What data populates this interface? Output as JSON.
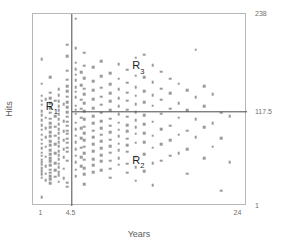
{
  "chart_data": {
    "type": "scatter",
    "title": "",
    "xlabel": "Years",
    "ylabel": "Hits",
    "xlim": [
      0,
      25
    ],
    "ylim": [
      1,
      238
    ],
    "grid": false,
    "legend": null,
    "xticks": [
      {
        "value": 1,
        "label": "1"
      },
      {
        "value": 4.5,
        "label": "4.5"
      },
      {
        "value": 24,
        "label": "24"
      }
    ],
    "yticks": [
      {
        "value": 238,
        "label": "238"
      },
      {
        "value": 117.5,
        "label": "117.5"
      },
      {
        "value": 1,
        "label": "1"
      }
    ],
    "splits": [
      {
        "name": "years-split",
        "orientation": "vertical",
        "value": 4.5,
        "variable": "Years"
      },
      {
        "name": "hits-split",
        "orientation": "horizontal",
        "value": 117.5,
        "variable": "Hits",
        "x_from": 4.5,
        "x_to": 24
      }
    ],
    "annotations": [
      {
        "name": "R1",
        "text": "R",
        "subscript": "1",
        "x": 2.2,
        "y": 122
      },
      {
        "name": "R2",
        "text": "R",
        "subscript": "2",
        "x": 12.3,
        "y": 55
      },
      {
        "name": "R3",
        "text": "R",
        "subscript": "3",
        "x": 12.3,
        "y": 172
      },
      {
        "name": "top-axis-value",
        "text": "238",
        "x": 25.6,
        "y": 238
      },
      {
        "name": "mid-axis-value",
        "text": "117.5",
        "x": 25.6,
        "y": 117.5
      },
      {
        "name": "bottom-axis-value",
        "text": "1",
        "x": 25.6,
        "y": 1
      }
    ],
    "point_color": "#9a9a9a",
    "point_marker": "square",
    "points": [
      [
        1,
        182
      ],
      [
        1,
        152
      ],
      [
        1,
        137
      ],
      [
        1,
        131
      ],
      [
        1,
        126
      ],
      [
        1,
        118
      ],
      [
        1,
        113
      ],
      [
        1,
        107
      ],
      [
        1,
        101
      ],
      [
        1,
        95
      ],
      [
        1,
        89
      ],
      [
        1,
        83
      ],
      [
        1,
        78
      ],
      [
        1,
        72
      ],
      [
        1,
        67
      ],
      [
        1,
        63
      ],
      [
        1,
        58
      ],
      [
        1,
        55
      ],
      [
        1,
        52
      ],
      [
        1,
        48
      ],
      [
        1,
        44
      ],
      [
        1,
        40
      ],
      [
        1,
        36
      ],
      [
        1,
        12
      ],
      [
        1.5,
        133
      ],
      [
        1.5,
        110
      ],
      [
        1.5,
        97
      ],
      [
        1.5,
        86
      ],
      [
        1.5,
        74
      ],
      [
        1.5,
        62
      ],
      [
        1.5,
        50
      ],
      [
        1.5,
        41
      ],
      [
        1.5,
        33
      ],
      [
        2,
        160
      ],
      [
        2,
        141
      ],
      [
        2,
        134
      ],
      [
        2,
        128
      ],
      [
        2,
        122
      ],
      [
        2,
        116
      ],
      [
        2,
        109
      ],
      [
        2,
        103
      ],
      [
        2,
        98
      ],
      [
        2,
        92
      ],
      [
        2,
        87
      ],
      [
        2,
        81
      ],
      [
        2,
        76
      ],
      [
        2,
        70
      ],
      [
        2,
        65
      ],
      [
        2,
        60
      ],
      [
        2,
        56
      ],
      [
        2,
        51
      ],
      [
        2,
        46
      ],
      [
        2,
        42
      ],
      [
        2,
        38
      ],
      [
        2,
        34
      ],
      [
        2,
        29
      ],
      [
        2.6,
        131
      ],
      [
        2.6,
        112
      ],
      [
        2.6,
        99
      ],
      [
        2.6,
        88
      ],
      [
        2.6,
        77
      ],
      [
        2.6,
        66
      ],
      [
        2.6,
        54
      ],
      [
        2.6,
        45
      ],
      [
        2.6,
        37
      ],
      [
        3,
        145
      ],
      [
        3,
        138
      ],
      [
        3,
        130
      ],
      [
        3,
        124
      ],
      [
        3,
        119
      ],
      [
        3,
        114
      ],
      [
        3,
        108
      ],
      [
        3,
        102
      ],
      [
        3,
        96
      ],
      [
        3,
        91
      ],
      [
        3,
        85
      ],
      [
        3,
        80
      ],
      [
        3,
        75
      ],
      [
        3,
        69
      ],
      [
        3,
        64
      ],
      [
        3,
        59
      ],
      [
        3,
        53
      ],
      [
        3,
        49
      ],
      [
        3,
        43
      ],
      [
        3,
        39
      ],
      [
        3,
        31
      ],
      [
        3.6,
        127
      ],
      [
        3.6,
        106
      ],
      [
        3.6,
        93
      ],
      [
        3.6,
        82
      ],
      [
        3.6,
        71
      ],
      [
        3.6,
        61
      ],
      [
        3.6,
        47
      ],
      [
        3.6,
        35
      ],
      [
        4,
        200
      ],
      [
        4,
        186
      ],
      [
        4,
        168
      ],
      [
        4,
        157
      ],
      [
        4,
        149
      ],
      [
        4,
        143
      ],
      [
        4,
        136
      ],
      [
        4,
        129
      ],
      [
        4,
        123
      ],
      [
        4,
        117
      ],
      [
        4,
        111
      ],
      [
        4,
        105
      ],
      [
        4,
        100
      ],
      [
        4,
        94
      ],
      [
        4,
        90
      ],
      [
        4,
        84
      ],
      [
        4,
        79
      ],
      [
        4,
        73
      ],
      [
        4,
        68
      ],
      [
        4,
        57
      ],
      [
        4,
        30
      ],
      [
        4,
        25
      ],
      [
        5,
        232
      ],
      [
        5,
        196
      ],
      [
        5,
        178
      ],
      [
        5,
        170
      ],
      [
        5,
        163
      ],
      [
        5,
        156
      ],
      [
        5,
        148
      ],
      [
        5,
        142
      ],
      [
        5,
        135
      ],
      [
        5,
        125
      ],
      [
        5,
        120
      ],
      [
        5,
        115
      ],
      [
        5,
        104
      ],
      [
        5,
        96
      ],
      [
        5,
        88
      ],
      [
        5,
        80
      ],
      [
        5,
        71
      ],
      [
        5,
        63
      ],
      [
        5,
        55
      ],
      [
        5,
        46
      ],
      [
        5,
        38
      ],
      [
        5.6,
        166
      ],
      [
        5.6,
        150
      ],
      [
        5.6,
        132
      ],
      [
        5.6,
        121
      ],
      [
        5.6,
        110
      ],
      [
        5.6,
        97
      ],
      [
        5.6,
        85
      ],
      [
        5.6,
        73
      ],
      [
        5.6,
        61
      ],
      [
        5.6,
        50
      ],
      [
        6,
        190
      ],
      [
        6,
        174
      ],
      [
        6,
        159
      ],
      [
        6,
        146
      ],
      [
        6,
        139
      ],
      [
        6,
        128
      ],
      [
        6,
        118
      ],
      [
        6,
        108
      ],
      [
        6,
        99
      ],
      [
        6,
        91
      ],
      [
        6,
        82
      ],
      [
        6,
        74
      ],
      [
        6,
        66
      ],
      [
        6,
        58
      ],
      [
        6,
        48
      ],
      [
        6,
        40
      ],
      [
        6,
        28
      ],
      [
        7,
        172
      ],
      [
        7,
        155
      ],
      [
        7,
        144
      ],
      [
        7,
        133
      ],
      [
        7,
        122
      ],
      [
        7,
        112
      ],
      [
        7,
        103
      ],
      [
        7,
        94
      ],
      [
        7,
        86
      ],
      [
        7,
        77
      ],
      [
        7,
        69
      ],
      [
        7,
        59
      ],
      [
        7,
        51
      ],
      [
        7,
        43
      ],
      [
        8,
        180
      ],
      [
        8,
        161
      ],
      [
        8,
        147
      ],
      [
        8,
        136
      ],
      [
        8,
        126
      ],
      [
        8,
        116
      ],
      [
        8,
        106
      ],
      [
        8,
        97
      ],
      [
        8,
        89
      ],
      [
        8,
        81
      ],
      [
        8,
        72
      ],
      [
        8,
        64
      ],
      [
        8,
        56
      ],
      [
        8,
        45
      ],
      [
        9,
        165
      ],
      [
        9,
        151
      ],
      [
        9,
        140
      ],
      [
        9,
        130
      ],
      [
        9,
        119
      ],
      [
        9,
        109
      ],
      [
        9,
        100
      ],
      [
        9,
        92
      ],
      [
        9,
        83
      ],
      [
        9,
        75
      ],
      [
        9,
        67
      ],
      [
        9,
        57
      ],
      [
        9,
        47
      ],
      [
        9,
        36
      ],
      [
        10,
        176
      ],
      [
        10,
        158
      ],
      [
        10,
        145
      ],
      [
        10,
        134
      ],
      [
        10,
        124
      ],
      [
        10,
        114
      ],
      [
        10,
        104
      ],
      [
        10,
        95
      ],
      [
        10,
        87
      ],
      [
        10,
        78
      ],
      [
        10,
        70
      ],
      [
        10,
        60
      ],
      [
        10,
        52
      ],
      [
        11,
        169
      ],
      [
        11,
        153
      ],
      [
        11,
        141
      ],
      [
        11,
        131
      ],
      [
        11,
        120
      ],
      [
        11,
        111
      ],
      [
        11,
        101
      ],
      [
        11,
        93
      ],
      [
        11,
        84
      ],
      [
        11,
        76
      ],
      [
        11,
        68
      ],
      [
        11,
        53
      ],
      [
        11,
        42
      ],
      [
        12,
        184
      ],
      [
        12,
        162
      ],
      [
        12,
        148
      ],
      [
        12,
        137
      ],
      [
        12,
        127
      ],
      [
        12,
        117
      ],
      [
        12,
        107
      ],
      [
        12,
        98
      ],
      [
        12,
        90
      ],
      [
        12,
        79
      ],
      [
        12,
        62
      ],
      [
        12,
        49
      ],
      [
        12,
        32
      ],
      [
        13,
        188
      ],
      [
        13,
        160
      ],
      [
        13,
        143
      ],
      [
        13,
        129
      ],
      [
        13,
        113
      ],
      [
        13,
        102
      ],
      [
        13,
        91
      ],
      [
        13,
        80
      ],
      [
        13,
        65
      ],
      [
        13,
        44
      ],
      [
        14,
        175
      ],
      [
        14,
        154
      ],
      [
        14,
        138
      ],
      [
        14,
        125
      ],
      [
        14,
        105
      ],
      [
        14,
        88
      ],
      [
        14,
        73
      ],
      [
        14,
        54
      ],
      [
        14,
        27
      ],
      [
        15,
        167
      ],
      [
        15,
        146
      ],
      [
        15,
        132
      ],
      [
        15,
        115
      ],
      [
        15,
        96
      ],
      [
        15,
        77
      ],
      [
        15,
        57
      ],
      [
        16,
        158
      ],
      [
        16,
        140
      ],
      [
        16,
        121
      ],
      [
        16,
        100
      ],
      [
        16,
        82
      ],
      [
        16,
        63
      ],
      [
        17,
        152
      ],
      [
        17,
        128
      ],
      [
        17,
        110
      ],
      [
        17,
        89
      ],
      [
        17,
        66
      ],
      [
        18,
        144
      ],
      [
        18,
        119
      ],
      [
        18,
        94
      ],
      [
        18,
        71
      ],
      [
        18,
        41
      ],
      [
        19,
        194
      ],
      [
        19,
        135
      ],
      [
        19,
        108
      ],
      [
        19,
        86
      ],
      [
        20,
        149
      ],
      [
        20,
        124
      ],
      [
        20,
        98
      ],
      [
        20,
        60
      ],
      [
        21,
        139
      ],
      [
        21,
        103
      ],
      [
        21,
        74
      ],
      [
        22,
        116
      ],
      [
        22,
        85
      ],
      [
        22,
        20
      ],
      [
        23,
        112
      ],
      [
        23,
        55
      ]
    ]
  },
  "axes": {
    "x_title": "Years",
    "y_title": "Hits"
  }
}
